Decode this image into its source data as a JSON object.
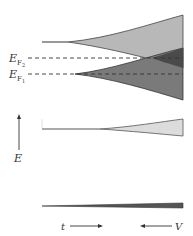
{
  "diagram": {
    "type": "energy-band-splitting",
    "labels": {
      "fermi_level_2": {
        "main": "E",
        "sub": "F",
        "subsub": "2"
      },
      "fermi_level_1": {
        "main": "E",
        "sub": "F",
        "subsub": "1"
      },
      "energy_axis": "E",
      "time_axis": "t",
      "volume_axis": "V"
    },
    "bands": [
      {
        "name": "band-1",
        "fill": "#b8b8b8",
        "edge": "#444444"
      },
      {
        "name": "band-2",
        "fill": "#7a7a7a",
        "edge": "#333333"
      },
      {
        "name": "band-3",
        "fill": "#dcdcdc",
        "edge": "#555555"
      },
      {
        "name": "band-4",
        "fill": "#555555",
        "edge": "#333333"
      }
    ],
    "overlap_fill": "#4a4a4a",
    "dashed_line_color": "#333333"
  }
}
